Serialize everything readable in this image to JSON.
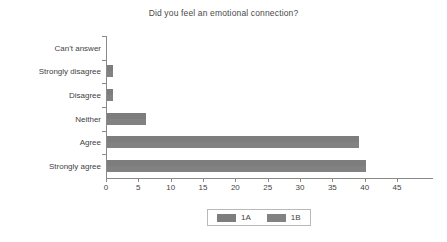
{
  "chart_data": {
    "type": "bar",
    "orientation": "horizontal",
    "title": "Did you feel an emotional connection?",
    "xlabel": "",
    "ylabel": "",
    "xlim": [
      0,
      45
    ],
    "xticks": [
      "0",
      "5",
      "10",
      "15",
      "20",
      "25",
      "30",
      "35",
      "40",
      "45"
    ],
    "grid": false,
    "legend_position": "bottom",
    "categories": [
      "Can't answer",
      "Strongly disagree",
      "Disagree",
      "Neither",
      "Agree",
      "Strongly agree"
    ],
    "series": [
      {
        "name": "1A",
        "color": "#7d7d7d",
        "values": [
          0,
          1,
          1,
          6,
          39,
          40
        ]
      },
      {
        "name": "1B",
        "color": "#828282",
        "values": [
          0,
          1,
          1,
          6,
          39,
          40
        ]
      }
    ]
  },
  "legend": {
    "items": [
      {
        "label": "1A",
        "color": "#7d7d7d"
      },
      {
        "label": "1B",
        "color": "#828282"
      }
    ]
  },
  "axis": {
    "axis_color": "#8a8a8a"
  }
}
